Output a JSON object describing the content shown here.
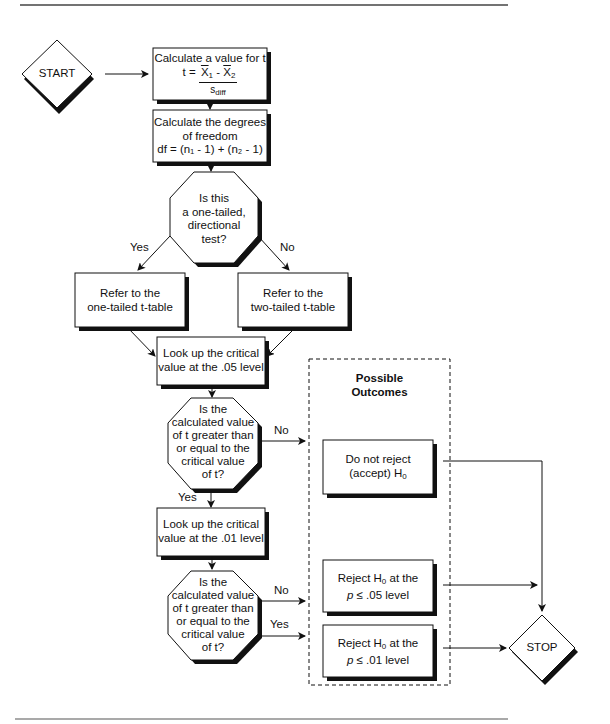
{
  "terminals": {
    "start": "START",
    "stop": "STOP"
  },
  "steps": {
    "calc_t": {
      "line1": "Calculate a value for t",
      "formula_lhs": "t = ",
      "x1": "X",
      "x1_sub": "1",
      "minus": " - ",
      "x2": "X",
      "x2_sub": "2",
      "denominator": "s",
      "denominator_sub": "diff"
    },
    "calc_df": {
      "line1": "Calculate the degrees",
      "line2": "of freedom",
      "formula": "df = (n₁ - 1) + (n₂ - 1)"
    },
    "one_tailed_table": {
      "line1": "Refer to the",
      "line2": "one-tailed t-table"
    },
    "two_tailed_table": {
      "line1": "Refer to the",
      "line2": "two-tailed t-table"
    },
    "lookup_05": {
      "line1": "Look up the critical",
      "line2": "value at the .05 level"
    },
    "lookup_01": {
      "line1": "Look up the critical",
      "line2": "value at the .01 level"
    }
  },
  "decisions": {
    "directional": {
      "lines": [
        "Is this",
        "a one-tailed,",
        "directional",
        "test?"
      ],
      "yes": "Yes",
      "no": "No"
    },
    "compare_05": {
      "lines": [
        "Is the",
        "calculated value",
        "of t greater than",
        "or equal to the",
        "critical value",
        "of t?"
      ],
      "yes": "Yes",
      "no": "No"
    },
    "compare_01": {
      "lines": [
        "Is the",
        "calculated value",
        "of t greater than",
        "or equal to the",
        "critical value",
        "of t?"
      ],
      "yes": "Yes",
      "no": "No"
    }
  },
  "outcomes": {
    "title_line1": "Possible",
    "title_line2": "Outcomes",
    "accept": {
      "line1": "Do not reject",
      "line2_pre": "(accept) H",
      "line2_sub": "0"
    },
    "reject_05": {
      "line1_pre": "Reject H",
      "line1_sub": "0",
      "line1_post": " at the",
      "p": "p",
      "line2_post": " ≤ .05 level"
    },
    "reject_01": {
      "line1_pre": "Reject H",
      "line1_sub": "0",
      "line1_post": " at the",
      "p": "p",
      "line2_post": " ≤ .01 level"
    }
  }
}
